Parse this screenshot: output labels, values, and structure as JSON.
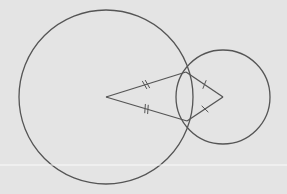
{
  "diagram": {
    "type": "geometry-construction",
    "background": "#e4e4e4",
    "stroke_color": "#555555",
    "circles": [
      {
        "name": "large-circle",
        "cx": 106,
        "cy": 97,
        "r": 87
      },
      {
        "name": "small-circle",
        "cx": 223,
        "cy": 97,
        "r": 47
      }
    ],
    "points": {
      "A": {
        "x": 106,
        "y": 97
      },
      "B": {
        "x": 186,
        "y": 72
      },
      "C": {
        "x": 223,
        "y": 97
      },
      "D": {
        "x": 187,
        "y": 121
      }
    },
    "segments": [
      {
        "from": "A",
        "to": "B",
        "ticks": 2
      },
      {
        "from": "A",
        "to": "D",
        "ticks": 2
      },
      {
        "from": "C",
        "to": "B",
        "ticks": 1
      },
      {
        "from": "C",
        "to": "D",
        "ticks": 1
      }
    ],
    "scan_line_y": 165
  }
}
